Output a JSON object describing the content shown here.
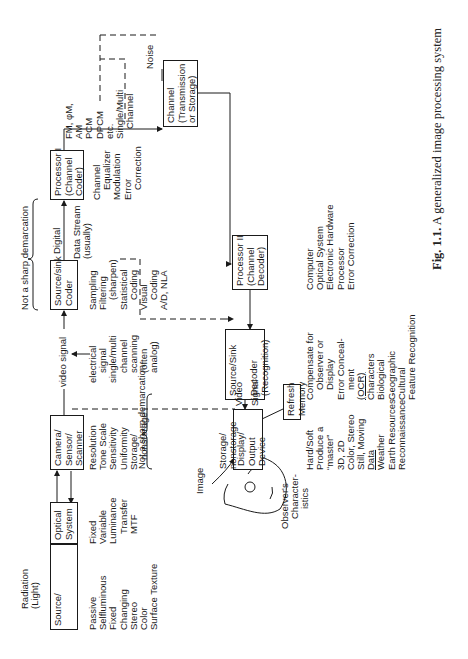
{
  "figure": {
    "caption_label": "Fig. 1.1.",
    "caption_text": "A generalized image processing system",
    "orientation": "rotated 90° counter-clockwise"
  },
  "labels": {
    "radiation": [
      "Radiation",
      "(Light)"
    ],
    "not_sharp_top": "Not a sharp demarcation",
    "not_sharp_mid": "Not a sharp demarcation",
    "digital": "Digital",
    "data_stream": [
      "Data Stream",
      "(usually)"
    ],
    "video_signal": "video signal",
    "noise": "Noise",
    "image": "Image",
    "storage": [
      "Storage/",
      "nonstorage"
    ],
    "video": "Video",
    "signal": "Signal",
    "observer": [
      "Observer's",
      "Character-",
      "istics"
    ]
  },
  "boxes": {
    "source_object": [
      "Source/",
      "Object",
      "SNR"
    ],
    "optical_system": [
      "Optical",
      "System"
    ],
    "camera": [
      "Camera/",
      "Sensor/",
      "Scanner"
    ],
    "coder": [
      "Source/sink",
      "Coder"
    ],
    "processor1": [
      "Processor I",
      "(Channel",
      "Coder)"
    ],
    "channel": [
      "Channel",
      "(Transmission",
      "or Storage)"
    ],
    "processor2": [
      "Processor II",
      "(Channel",
      "Decoder)"
    ],
    "decoder": [
      "Source/Sink",
      "",
      "Decoder",
      "(Recognition)"
    ],
    "display": [
      "Display/",
      "Output",
      "Device"
    ],
    "refresh": [
      "Refresh",
      "Memory"
    ]
  },
  "lists": {
    "source_props": [
      "Passive",
      "Selfluminous",
      "Fixed",
      "Changing",
      "Stereo",
      "Color",
      "Surface Texture"
    ],
    "optical_props": [
      "Fixed",
      "Variable",
      "Luminance",
      "Transfer",
      "MTF"
    ],
    "camera_props": [
      "Resolution",
      "Tone Scale",
      "Sensitivity",
      "Uniformity",
      "Storage/",
      "nonstorage"
    ],
    "signal_props": [
      "electrical",
      "signal",
      "single/multi",
      "channel",
      "scanning",
      "(often",
      "analog)"
    ],
    "coder_props": [
      "Sampling",
      "Filtering",
      "(sharpen)",
      "Statistical",
      "Coding",
      "Visual",
      "Coding",
      "A/D, NLA"
    ],
    "processor1_props": [
      "Channel",
      "Equalizer",
      "Modulation",
      "Error",
      "Correction"
    ],
    "modulation": [
      "FM, φM,",
      "AM",
      "PCM",
      "DPCM",
      "etc.",
      "Single/Multi",
      "Channel"
    ],
    "display_props": [
      "Hard/Soft",
      "Produce a",
      "“master”",
      "3D, 2D",
      "Color, Stereo",
      "Still, Moving",
      "Data",
      "Weather",
      "Earth Resources",
      "Reconnaissance"
    ],
    "decoder_props": [
      "Compensate for",
      "Observer or",
      "Display",
      "Error Conceal-",
      "ment",
      "(OCR)",
      "Characters",
      "Biological",
      "Geographic",
      "Cultural",
      "Feature Recognition"
    ],
    "processor2_props": [
      "Computer",
      "Optical System",
      "Electronic Hardware",
      "Processor",
      "Error Correction"
    ]
  }
}
